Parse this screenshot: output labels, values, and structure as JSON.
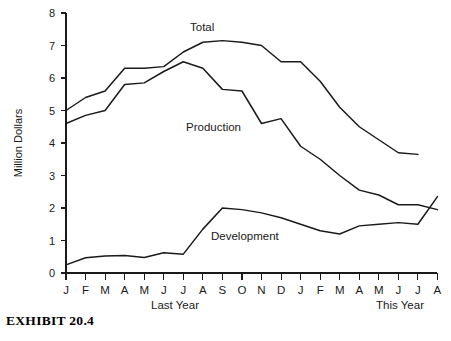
{
  "figure": {
    "caption": "EXHIBIT 20.4"
  },
  "chart_data": {
    "type": "line",
    "title": "",
    "xlabel": "",
    "ylabel": "Million Dollars",
    "ylim": [
      0,
      8
    ],
    "yticks": [
      0,
      1,
      2,
      3,
      4,
      5,
      6,
      7,
      8
    ],
    "grid": false,
    "legend_position": "inline-annotation",
    "categories": [
      "J",
      "F",
      "M",
      "A",
      "M",
      "J",
      "J",
      "A",
      "S",
      "O",
      "N",
      "D",
      "J",
      "F",
      "M",
      "A",
      "M",
      "J",
      "J",
      "A"
    ],
    "period_labels": [
      {
        "text": "Last Year",
        "span": [
          "J",
          "D"
        ]
      },
      {
        "text": "This Year",
        "span": [
          "J",
          "A"
        ]
      }
    ],
    "series": [
      {
        "name": "Total",
        "label": "Total",
        "values": [
          5.0,
          5.4,
          5.6,
          6.3,
          6.3,
          6.35,
          6.8,
          7.1,
          7.15,
          7.1,
          7.0,
          6.5,
          6.5,
          5.9,
          5.1,
          4.5,
          4.1,
          3.7,
          3.65,
          null
        ]
      },
      {
        "name": "Production",
        "label": "Production",
        "values": [
          4.6,
          4.85,
          5.0,
          5.8,
          5.85,
          6.2,
          6.5,
          6.3,
          5.65,
          5.6,
          4.6,
          4.75,
          3.9,
          3.5,
          3.0,
          2.55,
          2.4,
          2.1,
          2.1,
          1.95
        ]
      },
      {
        "name": "Development",
        "label": "Development",
        "values": [
          0.25,
          0.47,
          0.52,
          0.54,
          0.48,
          0.62,
          0.58,
          1.35,
          2.0,
          1.95,
          1.85,
          1.7,
          1.5,
          1.3,
          1.2,
          1.45,
          1.5,
          1.55,
          1.5,
          2.35
        ]
      }
    ]
  }
}
